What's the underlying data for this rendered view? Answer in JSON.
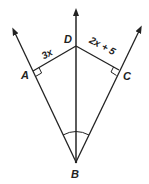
{
  "diagram": {
    "points": {
      "A": {
        "label": "A"
      },
      "B": {
        "label": "B"
      },
      "C": {
        "label": "C"
      },
      "D": {
        "label": "D"
      }
    },
    "segments": {
      "AD": {
        "label": "3x"
      },
      "DC": {
        "label": "2x + 5"
      }
    },
    "markers": {
      "right_angle_A": "right-angle at A",
      "right_angle_C": "right-angle at C",
      "angle_arc_B": "congruent angles at B"
    },
    "colors": {
      "stroke": "#222222",
      "background": "#ffffff"
    }
  }
}
